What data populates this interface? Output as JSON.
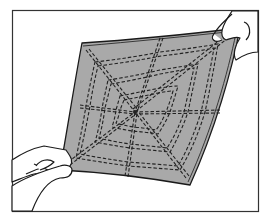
{
  "illustration": {
    "subject": "hands holding a square of fabric stitched with a spiderweb pattern",
    "colors": {
      "background": "#ffffff",
      "frame": "#333333",
      "fabric": "#a9a9a9",
      "stitch": "#222222",
      "outline": "#1a1a1a"
    }
  }
}
